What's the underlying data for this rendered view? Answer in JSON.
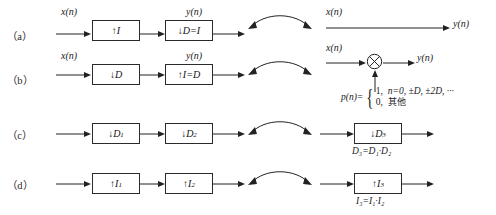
{
  "figure": {
    "rows": [
      {
        "label": "（a）",
        "left": {
          "input_label": "x(n)",
          "output_label": "y(n)",
          "blocks": [
            {
              "symbol": "↑",
              "text": "I"
            },
            {
              "symbol": "↓",
              "text": "D=I"
            }
          ]
        },
        "right": {
          "kind": "wire",
          "input_label": "x(n)",
          "output_label": "y(n)"
        }
      },
      {
        "label": "（b）",
        "left": {
          "input_label": "x(n)",
          "output_label": "y(n)",
          "blocks": [
            {
              "symbol": "↓",
              "text": "D"
            },
            {
              "symbol": "↑",
              "text": "I=D"
            }
          ]
        },
        "right": {
          "kind": "multiplier",
          "input_label": "x(n)",
          "output_label": "y(n)",
          "control_label": "p(n)",
          "formula": {
            "lhs": "p(n)=",
            "cases": [
              {
                "value": "1,",
                "condition": "n=0, ±D, ±2D, ···",
                "cjk": false
              },
              {
                "value": "0,",
                "condition": "其他",
                "cjk": true
              }
            ]
          }
        }
      },
      {
        "label": "（c）",
        "left": {
          "input_label": "",
          "output_label": "",
          "blocks": [
            {
              "symbol": "↓",
              "text": "D",
              "sub": "1"
            },
            {
              "symbol": "↓",
              "text": "D",
              "sub": "2"
            }
          ]
        },
        "right": {
          "kind": "block",
          "block": {
            "symbol": "↓",
            "text": "D",
            "sub": "3"
          },
          "equation": "D₃=D₁·D₂"
        }
      },
      {
        "label": "（d）",
        "left": {
          "input_label": "",
          "output_label": "",
          "blocks": [
            {
              "symbol": "↑",
              "text": "I",
              "sub": "1"
            },
            {
              "symbol": "↑",
              "text": "I",
              "sub": "2"
            }
          ]
        },
        "right": {
          "kind": "block",
          "block": {
            "symbol": "↑",
            "text": "I",
            "sub": "3"
          },
          "equation": "I₃=I₁·I₂"
        }
      }
    ],
    "equivalence_arc": "double-headed-curved-arrow",
    "colors": {
      "line": "#222222",
      "text": "#1a1a1a",
      "background": "#ffffff"
    }
  }
}
